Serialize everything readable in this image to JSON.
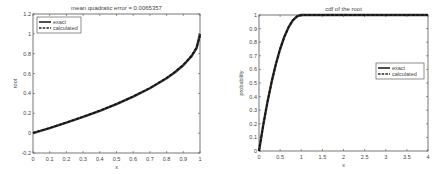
{
  "chart_data": [
    {
      "type": "line",
      "title": "mean quadratic error = 0.0065357",
      "xlabel": "x",
      "ylabel": "root",
      "xlim": [
        0,
        1
      ],
      "ylim": [
        -0.2,
        1.2
      ],
      "xticks": [
        0,
        0.1,
        0.2,
        0.3,
        0.4,
        0.5,
        0.6,
        0.7,
        0.8,
        0.9,
        1
      ],
      "xtick_labels": [
        "0",
        "0.1",
        "0.2",
        "0.3",
        "0.4",
        "0.5",
        "0.6",
        "0.7",
        "0.8",
        "0.9",
        "1"
      ],
      "yticks": [
        -0.2,
        0,
        0.2,
        0.4,
        0.6,
        0.8,
        1,
        1.2
      ],
      "ytick_labels": [
        "-0.2",
        "0",
        "0.2",
        "0.4",
        "0.6",
        "0.8",
        "1",
        "1.2"
      ],
      "grid": false,
      "legend_position": "upper left",
      "box": {
        "left": 33,
        "top": 14,
        "right": 200,
        "bottom": 153
      },
      "legend_box": {
        "x": 37,
        "y": 17,
        "w": 44,
        "h": 16
      },
      "series": [
        {
          "name": "exact",
          "style": "solid",
          "x": [
            0,
            0.1,
            0.2,
            0.3,
            0.4,
            0.5,
            0.6,
            0.7,
            0.8,
            0.85,
            0.9,
            0.95,
            0.98,
            1
          ],
          "y": [
            0,
            0.051,
            0.106,
            0.163,
            0.225,
            0.293,
            0.368,
            0.452,
            0.553,
            0.613,
            0.684,
            0.776,
            0.859,
            1
          ]
        },
        {
          "name": "calculated",
          "style": "dashed",
          "x": [
            0,
            0.1,
            0.2,
            0.3,
            0.4,
            0.5,
            0.6,
            0.7,
            0.8,
            0.85,
            0.9,
            0.95,
            0.98,
            1
          ],
          "y": [
            0.003,
            0.053,
            0.108,
            0.165,
            0.227,
            0.295,
            0.371,
            0.455,
            0.556,
            0.617,
            0.689,
            0.782,
            0.865,
            0.98
          ]
        }
      ]
    },
    {
      "type": "line",
      "title": "cdf of the root",
      "xlabel": "x",
      "ylabel": "probability",
      "xlim": [
        0,
        4
      ],
      "ylim": [
        0,
        1
      ],
      "xticks": [
        0,
        0.5,
        1,
        1.5,
        2,
        2.5,
        3,
        3.5,
        4
      ],
      "xtick_labels": [
        "0",
        "0.5",
        "1",
        "1.5",
        "2",
        "2.5",
        "3",
        "3.5",
        "4"
      ],
      "yticks": [
        0,
        0.1,
        0.2,
        0.3,
        0.4,
        0.5,
        0.6,
        0.7,
        0.8,
        0.9,
        1
      ],
      "ytick_labels": [
        "0",
        "0.1",
        "0.2",
        "0.3",
        "0.4",
        "0.5",
        "0.6",
        "0.7",
        "0.8",
        "0.9",
        "1"
      ],
      "grid": false,
      "legend_position": "right",
      "box": {
        "left": 259,
        "top": 15,
        "right": 428,
        "bottom": 151
      },
      "legend_box": {
        "x": 376,
        "y": 63,
        "w": 48,
        "h": 16
      },
      "series": [
        {
          "name": "exact",
          "style": "solid",
          "x": [
            0,
            0.1,
            0.2,
            0.3,
            0.4,
            0.5,
            0.6,
            0.7,
            0.8,
            0.9,
            1,
            4
          ],
          "y": [
            0,
            0.19,
            0.36,
            0.51,
            0.64,
            0.75,
            0.84,
            0.91,
            0.96,
            0.99,
            1,
            1
          ]
        },
        {
          "name": "calculated",
          "style": "dashed",
          "x": [
            0,
            0.1,
            0.2,
            0.3,
            0.4,
            0.5,
            0.6,
            0.7,
            0.8,
            0.9,
            1,
            4
          ],
          "y": [
            0,
            0.19,
            0.36,
            0.51,
            0.64,
            0.75,
            0.84,
            0.91,
            0.96,
            0.99,
            1,
            1
          ]
        }
      ]
    }
  ]
}
